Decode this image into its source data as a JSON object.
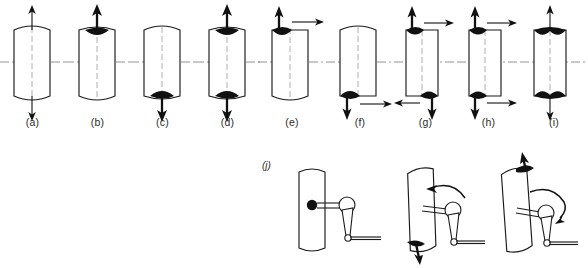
{
  "figure": {
    "type": "technical-line-diagram",
    "title_text": "",
    "background_color": "#ffffff",
    "ink_color": "#111111",
    "axis_color": "#7a7a7a",
    "row1_label_y": 116,
    "panel_labels": [
      "(a)",
      "(b)",
      "(c)",
      "(d)",
      "(e)",
      "(f)",
      "(g)",
      "(h)",
      "(i)"
    ],
    "bottom_label": "(j)",
    "panels": [
      {
        "id": "a",
        "label": "(a)",
        "shape": "cylinder-rounded-ends",
        "tilt_deg": 0,
        "center_axis": true,
        "vertical_dashed_axis": true,
        "top_blob": false,
        "bottom_blob": false,
        "arrows": [
          {
            "name": "top-up-arrow",
            "dir": "up",
            "weight": "thin",
            "position": "top-center"
          },
          {
            "name": "bottom-down-arrow",
            "dir": "down",
            "weight": "thin",
            "position": "bottom-center"
          }
        ]
      },
      {
        "id": "b",
        "label": "(b)",
        "shape": "cylinder-rounded-bottom",
        "tilt_deg": 0,
        "center_axis": true,
        "vertical_dashed_axis": true,
        "top_blob": true,
        "bottom_blob": false,
        "arrows": [
          {
            "name": "top-up-arrow",
            "dir": "up",
            "weight": "thick",
            "position": "top-center"
          }
        ]
      },
      {
        "id": "c",
        "label": "(c)",
        "shape": "cylinder-rounded-top",
        "tilt_deg": 0,
        "center_axis": true,
        "vertical_dashed_axis": true,
        "top_blob": false,
        "bottom_blob": true,
        "arrows": [
          {
            "name": "bottom-down-arrow",
            "dir": "down",
            "weight": "thick",
            "position": "bottom-center"
          }
        ]
      },
      {
        "id": "d",
        "label": "(d)",
        "shape": "cylinder-flat-ends",
        "tilt_deg": 0,
        "center_axis": true,
        "vertical_dashed_axis": true,
        "top_blob": true,
        "bottom_blob": true,
        "arrows": [
          {
            "name": "top-up-arrow",
            "dir": "up",
            "weight": "thick",
            "position": "top-center"
          },
          {
            "name": "bottom-down-arrow",
            "dir": "down",
            "weight": "thick",
            "position": "bottom-center"
          }
        ]
      },
      {
        "id": "e",
        "label": "(e)",
        "shape": "cylinder-rounded-bottom",
        "tilt_deg": 0,
        "center_axis": true,
        "vertical_dashed_axis": true,
        "top_blob": true,
        "bottom_blob": false,
        "arrows": [
          {
            "name": "top-up-arrow",
            "dir": "up",
            "weight": "thick",
            "position": "top-left"
          },
          {
            "name": "top-right-arrow",
            "dir": "right",
            "weight": "thin",
            "position": "top-right"
          }
        ]
      },
      {
        "id": "f",
        "label": "(f)",
        "shape": "cylinder-rounded-top",
        "tilt_deg": 0,
        "center_axis": true,
        "vertical_dashed_axis": true,
        "top_blob": false,
        "bottom_blob": true,
        "arrows": [
          {
            "name": "bottom-down-arrow",
            "dir": "down",
            "weight": "thick",
            "position": "bottom-left"
          },
          {
            "name": "bottom-right-arrow",
            "dir": "right",
            "weight": "thin",
            "position": "bottom-right"
          }
        ]
      },
      {
        "id": "g",
        "label": "(g)",
        "shape": "cylinder-flat-ends",
        "tilt_deg": 0,
        "center_axis": true,
        "vertical_dashed_axis": true,
        "top_blob": true,
        "bottom_blob": true,
        "arrows": [
          {
            "name": "top-up-arrow",
            "dir": "up",
            "weight": "thick",
            "position": "top-left"
          },
          {
            "name": "top-right-arrow",
            "dir": "right",
            "weight": "thin",
            "position": "top-right"
          },
          {
            "name": "bottom-down-arrow",
            "dir": "down",
            "weight": "thick",
            "position": "bottom-right"
          },
          {
            "name": "bottom-left-arrow",
            "dir": "left",
            "weight": "thin",
            "position": "bottom-left"
          }
        ]
      },
      {
        "id": "h",
        "label": "(h)",
        "shape": "cylinder-flat-ends",
        "tilt_deg": 0,
        "center_axis": true,
        "vertical_dashed_axis": true,
        "top_blob": true,
        "bottom_blob": true,
        "arrows": [
          {
            "name": "top-up-arrow",
            "dir": "up",
            "weight": "thick",
            "position": "top-left"
          },
          {
            "name": "top-right-arrow",
            "dir": "right",
            "weight": "thin",
            "position": "top-right"
          },
          {
            "name": "bottom-down-arrow",
            "dir": "down",
            "weight": "thick",
            "position": "bottom-left"
          },
          {
            "name": "bottom-right-arrow",
            "dir": "right",
            "weight": "thin",
            "position": "bottom-right"
          }
        ]
      },
      {
        "id": "i",
        "label": "(i)",
        "shape": "cylinder-flat-ends",
        "tilt_deg": 0,
        "center_axis": true,
        "vertical_dashed_axis": true,
        "top_blob": true,
        "bottom_blob": true,
        "blob_style": "full-width-wedge",
        "arrows": [
          {
            "name": "top-up-arrow",
            "dir": "up",
            "weight": "thin",
            "position": "top-center"
          },
          {
            "name": "bottom-down-arrow",
            "dir": "down",
            "weight": "thin",
            "position": "bottom-center"
          }
        ]
      }
    ],
    "bottom_row": {
      "label": "(j)",
      "description": "mechanism-sequence",
      "stages": [
        {
          "id": "j1",
          "name": "stage-upright",
          "tilt_deg": 0,
          "pivot_dot": true,
          "top_arrow": false,
          "bottom_arrow": false,
          "rotation_arc": "none"
        },
        {
          "id": "j2",
          "name": "stage-tilted-left",
          "tilt_deg": -12,
          "pivot_dot": false,
          "top_arrow": false,
          "bottom_arrow": true,
          "bottom_arrow_dir": "down",
          "rotation_arc": "counterclockwise"
        },
        {
          "id": "j3",
          "name": "stage-tilted-right",
          "tilt_deg": -14,
          "pivot_dot": false,
          "top_arrow": true,
          "top_arrow_dir": "up",
          "bottom_arrow": false,
          "rotation_arc": "clockwise"
        }
      ]
    }
  }
}
